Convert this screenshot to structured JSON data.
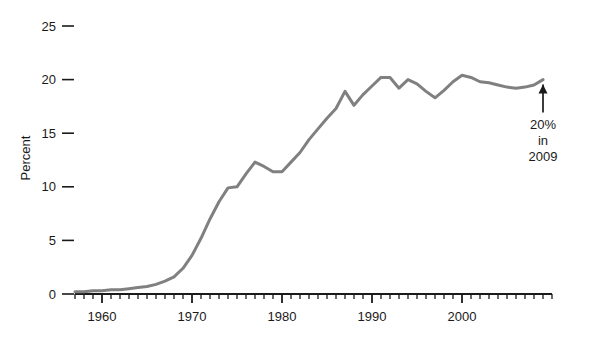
{
  "chart_data": {
    "type": "line",
    "title": "",
    "subtitle": "",
    "xlabel": "",
    "ylabel": "Percent",
    "xlim": [
      1957,
      2010
    ],
    "ylim": [
      0,
      26
    ],
    "yticks": [
      0,
      5,
      10,
      15,
      20,
      25
    ],
    "ytick_labels": [
      "0",
      "5",
      "10",
      "15",
      "20",
      "25"
    ],
    "xticks_major": [
      1960,
      1970,
      1980,
      1990,
      2000
    ],
    "xtick_labels": [
      "1960",
      "1970",
      "1980",
      "1990",
      "2000"
    ],
    "xticks_minor_step": 1,
    "grid": false,
    "legend": null,
    "line_color": "#808080",
    "line_width": 3,
    "annotations": [
      {
        "name": "endpoint-callout",
        "lines": [
          "20%",
          "in",
          "2009"
        ],
        "points_to_x": 2009,
        "points_to_y": 20.0,
        "arrow": "up"
      }
    ],
    "x": [
      1957,
      1958,
      1959,
      1960,
      1961,
      1962,
      1963,
      1964,
      1965,
      1966,
      1967,
      1968,
      1969,
      1970,
      1971,
      1972,
      1973,
      1974,
      1975,
      1976,
      1977,
      1978,
      1979,
      1980,
      1981,
      1982,
      1983,
      1984,
      1985,
      1986,
      1987,
      1988,
      1989,
      1990,
      1991,
      1992,
      1993,
      1994,
      1995,
      1996,
      1997,
      1998,
      1999,
      2000,
      2001,
      2002,
      2003,
      2004,
      2005,
      2006,
      2007,
      2008,
      2009
    ],
    "values": [
      0.2,
      0.2,
      0.3,
      0.3,
      0.4,
      0.4,
      0.5,
      0.6,
      0.7,
      0.9,
      1.2,
      1.6,
      2.4,
      3.6,
      5.2,
      7.0,
      8.6,
      9.9,
      10.0,
      11.2,
      12.3,
      11.9,
      11.4,
      11.4,
      12.3,
      13.2,
      14.4,
      15.4,
      16.4,
      17.3,
      18.9,
      17.6,
      18.6,
      19.4,
      20.2,
      20.2,
      19.2,
      20.0,
      19.6,
      18.9,
      18.3,
      19.0,
      19.8,
      20.4,
      20.2,
      19.8,
      19.7,
      19.5,
      19.3,
      19.2,
      19.3,
      19.5,
      20.0
    ]
  }
}
